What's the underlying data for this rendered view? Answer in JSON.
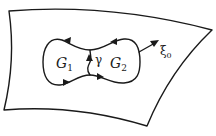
{
  "figure": {
    "type": "diagram",
    "colors": {
      "ink": "#1a1a1a",
      "background": "#ffffff"
    }
  },
  "labels": {
    "region1": {
      "main": "G",
      "sub": "1"
    },
    "region2": {
      "main": "G",
      "sub": "2"
    },
    "path": "γ",
    "vector": {
      "main": "ξ",
      "sub": "0"
    }
  },
  "arrows": [
    {
      "name": "top-left-boundary-arrow",
      "direction": "left"
    },
    {
      "name": "top-right-boundary-arrow",
      "direction": "left"
    },
    {
      "name": "bottom-left-boundary-arrow",
      "direction": "right"
    },
    {
      "name": "bottom-right-boundary-arrow",
      "direction": "right"
    },
    {
      "name": "gamma-arrow",
      "direction": "up"
    },
    {
      "name": "xi0-vector-arrow",
      "direction": "up-right"
    }
  ]
}
